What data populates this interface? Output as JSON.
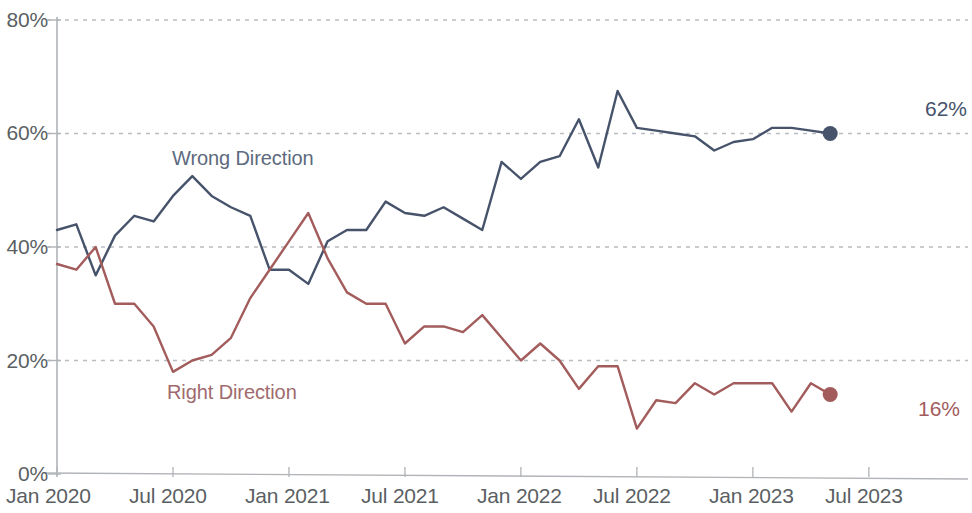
{
  "chart_data": {
    "type": "line",
    "title": "",
    "xlabel": "",
    "ylabel": "",
    "ylim": [
      0,
      80
    ],
    "grid": true,
    "grid_axis": "y",
    "legend": "inline-labels",
    "y_ticks": [
      "0%",
      "20%",
      "40%",
      "60%",
      "80%"
    ],
    "y_tick_values": [
      0,
      20,
      40,
      60,
      80
    ],
    "x_ticks": [
      "Jan 2020",
      "Jul 2020",
      "Jan 2021",
      "Jul 2021",
      "Jan 2022",
      "Jul 2022",
      "Jan 2023",
      "Jul 2023"
    ],
    "x_tick_months": [
      0,
      6,
      12,
      18,
      24,
      30,
      36,
      42
    ],
    "x_range_months": [
      0,
      46
    ],
    "series": [
      {
        "name": "Wrong Direction",
        "color": "#46536b",
        "label_color": "#5d6a7d",
        "end_value_label": "62%",
        "end_value": 60,
        "end_marker": true,
        "values": [
          43,
          44,
          35,
          42,
          45.5,
          44.5,
          49,
          52.5,
          49,
          47,
          45.5,
          36,
          36,
          33.5,
          41,
          43,
          43,
          48,
          46,
          45.5,
          47,
          45,
          43,
          55,
          52,
          55,
          56,
          62.5,
          54,
          67.5,
          61,
          60.5,
          60,
          59.5,
          57,
          58.5,
          59,
          61,
          61,
          60.5,
          60
        ]
      },
      {
        "name": "Right Direction",
        "color": "#a35c5c",
        "label_color": "#9f6a6d",
        "end_value_label": "16%",
        "end_value": 14,
        "end_marker": true,
        "values": [
          37,
          36,
          40,
          30,
          30,
          26,
          18,
          20,
          21,
          24,
          31,
          36,
          41,
          46,
          38,
          32,
          30,
          30,
          23,
          26,
          26,
          25,
          28,
          24,
          20,
          23,
          20,
          15,
          19,
          19,
          8,
          13,
          12.5,
          16,
          14,
          16,
          16,
          16,
          11,
          16,
          14
        ]
      }
    ]
  },
  "axis": {
    "y_tick_labels": [
      {
        "text": "80%",
        "value": 80
      },
      {
        "text": "60%",
        "value": 60
      },
      {
        "text": "40%",
        "value": 40
      },
      {
        "text": "20%",
        "value": 20
      },
      {
        "text": "0%",
        "value": 0
      }
    ],
    "x_tick_labels": [
      {
        "text": "Jan 2020",
        "month": 0
      },
      {
        "text": "Jul 2020",
        "month": 6
      },
      {
        "text": "Jan 2021",
        "month": 12
      },
      {
        "text": "Jul 2021",
        "month": 18
      },
      {
        "text": "Jan 2022",
        "month": 24
      },
      {
        "text": "Jul 2022",
        "month": 30
      },
      {
        "text": "Jan 2023",
        "month": 36
      },
      {
        "text": "Jul 2023",
        "month": 42
      }
    ]
  },
  "annotations": {
    "wrong_direction_label": "Wrong Direction",
    "right_direction_label": "Right Direction",
    "wrong_direction_end": "62%",
    "right_direction_end": "16%"
  },
  "colors": {
    "wrong_direction": "#46536b",
    "right_direction": "#a35c5c",
    "grid": "#b9bcc0",
    "axis": "#b0b3b7",
    "tick_text": "#5b5f63"
  }
}
